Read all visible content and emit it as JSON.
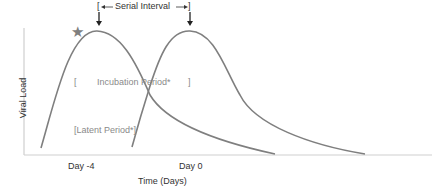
{
  "diagram": {
    "y_axis_label": "Viral Load",
    "x_axis_label": "Time (Days)",
    "x_ticks": [
      "Day -4",
      "Day 0"
    ],
    "annotations": {
      "serial_interval": "Serial Interval",
      "incubation_period": "Incubation Period*",
      "incubation_bracket_open": "[",
      "incubation_bracket_close": "]",
      "latent_period": "[Latent Period*]",
      "star": "★"
    },
    "colors": {
      "curve": "#7f7f7f",
      "axis": "#cfcfcf",
      "annotation_text": "#8a8a8a",
      "label_text": "#333333",
      "star": "#7f7f7f"
    },
    "curves": [
      {
        "name": "infector",
        "start_day": -4,
        "peak_label": "star"
      },
      {
        "name": "infectee",
        "start_day": 0
      }
    ]
  }
}
